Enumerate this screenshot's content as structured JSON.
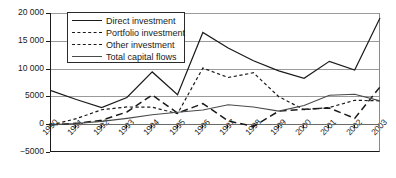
{
  "chart_data": {
    "type": "line",
    "title": "",
    "xlabel": "",
    "ylabel": "",
    "categories": [
      "1990",
      "1991",
      "1992",
      "1993",
      "1994",
      "1995",
      "1996",
      "1997",
      "1998",
      "1999",
      "2000",
      "2001",
      "2002",
      "2003"
    ],
    "ylim": [
      -5000,
      20000
    ],
    "yticks": [
      -5000,
      0,
      5000,
      10000,
      15000,
      20000
    ],
    "ytick_labels": [
      "−5000",
      "0",
      "5000",
      "10 000",
      "15 000",
      "20 000"
    ],
    "grid": true,
    "legend_position": "top-left",
    "series": [
      {
        "name": "Direct investment",
        "style": "solid",
        "color": "#1a1a1a",
        "values": [
          6050,
          4450,
          3000,
          4800,
          9400,
          5300,
          16500,
          13700,
          11400,
          9600,
          8250,
          11300,
          9750,
          19100
        ]
      },
      {
        "name": "Portfolio investment",
        "style": "long-dash",
        "color": "#1a1a1a",
        "values": [
          -100,
          150,
          700,
          2200,
          5250,
          2000,
          3700,
          600,
          -400,
          2350,
          2700,
          2900,
          1050,
          6700
        ]
      },
      {
        "name": "Other investment",
        "style": "short-dash",
        "color": "#1a1a1a",
        "values": [
          -150,
          1000,
          2600,
          3100,
          3050,
          1900,
          10100,
          8400,
          9250,
          4950,
          2600,
          3000,
          4300,
          4200
        ]
      },
      {
        "name": "Total capital flows",
        "style": "solid-thin",
        "color": "#4a4a4a",
        "values": [
          -50,
          120,
          500,
          1050,
          1700,
          2150,
          2550,
          3500,
          3100,
          2350,
          3350,
          5200,
          5400,
          4200
        ]
      }
    ]
  },
  "legend": {
    "items": [
      {
        "label": "Direct investment"
      },
      {
        "label": "Portfolio investment"
      },
      {
        "label": "Other investment"
      },
      {
        "label": "Total capital flows"
      }
    ]
  }
}
